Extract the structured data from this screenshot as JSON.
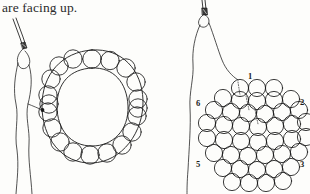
{
  "page": {
    "background_color": "#fdfdfb",
    "ink_color": "#1a1a1a",
    "width": 310,
    "height": 194
  },
  "caption": {
    "text": "are facing up."
  },
  "figures": [
    {
      "id": "oval-ring-figure",
      "name": "beaded-oval-ring-diagram",
      "description": "needle with thread attached to an oval ring of beads",
      "bead_count": 20,
      "shape": "oval",
      "has_knot_marker": true,
      "knot_marker_color": "#1a1a1a",
      "needle": {
        "name": "sewing-needle",
        "orientation": "upper-left",
        "has_eye": true
      },
      "thread": {
        "strand_count": 2,
        "style": "solid"
      }
    },
    {
      "id": "hex-cluster-figure",
      "name": "beaded-hexagon-cluster-diagram",
      "description": "needle with thread attached to a hexagonal cluster of beads with numbered corners",
      "shape": "hexagon",
      "rows": [
        3,
        5,
        7,
        7,
        7,
        6,
        5,
        4
      ],
      "needle": {
        "name": "sewing-needle",
        "orientation": "vertical",
        "has_eye": true
      },
      "thread": {
        "strand_count": 2,
        "style": "solid"
      },
      "dotted_thread_paths": 3,
      "corner_labels": [
        {
          "label": "1",
          "position": "top",
          "x": 248,
          "y": 72
        },
        {
          "label": "2",
          "position": "upper-right",
          "x": 300,
          "y": 98
        },
        {
          "label": "3",
          "position": "lower-right",
          "x": 300,
          "y": 160
        },
        {
          "label": "5",
          "position": "lower-left",
          "x": 196,
          "y": 160
        },
        {
          "label": "6",
          "position": "upper-left",
          "x": 196,
          "y": 99
        }
      ]
    }
  ]
}
